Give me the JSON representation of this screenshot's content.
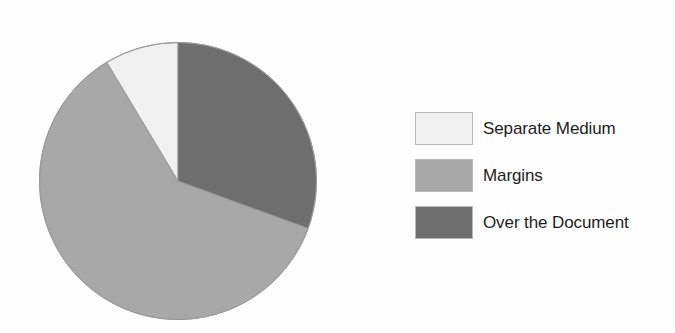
{
  "chart_data": {
    "type": "pie",
    "title": "",
    "subtitle": "",
    "xlabel": "",
    "ylabel": "",
    "grid": false,
    "legend_position": "right",
    "start_angle_deg": 0,
    "direction": "clockwise",
    "categories": [
      "Separate Medium",
      "Margins",
      "Over the Document"
    ],
    "values": [
      8.6,
      60.8,
      30.6
    ],
    "units": "percent",
    "slices": [
      {
        "label": "Separate Medium",
        "value": 8.6,
        "color": "#f0f0f0",
        "start_angle_deg": 329,
        "end_angle_deg": 360,
        "sweep_deg": 31
      },
      {
        "label": "Margins",
        "value": 60.8,
        "color": "#a8a8a8",
        "start_angle_deg": 110,
        "end_angle_deg": 329,
        "sweep_deg": 219
      },
      {
        "label": "Over the Document",
        "value": 30.6,
        "color": "#6e6e6e",
        "start_angle_deg": 0,
        "end_angle_deg": 110,
        "sweep_deg": 110
      }
    ]
  },
  "legend": {
    "items": [
      {
        "label": "Separate Medium",
        "color": "#f0f0f0"
      },
      {
        "label": "Margins",
        "color": "#a8a8a8"
      },
      {
        "label": "Over the Document",
        "color": "#6e6e6e"
      }
    ]
  },
  "colors": {
    "background": "#fefefe",
    "outline": "#9a9a9a",
    "swatch_border": "#b9b9b9",
    "text": "#1d1d1d",
    "light_slice": "#f0f0f0",
    "medium_slice": "#a8a8a8",
    "dark_slice": "#6e6e6e"
  }
}
